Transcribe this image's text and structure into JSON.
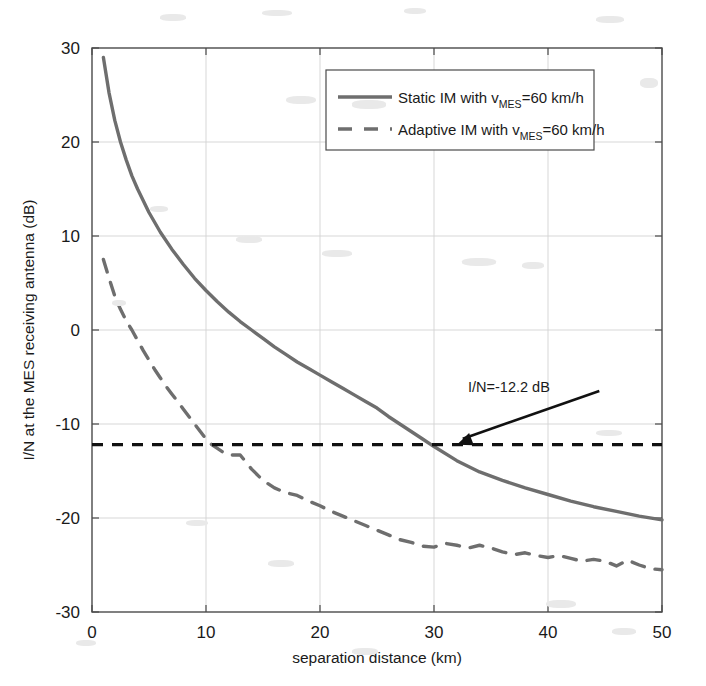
{
  "chart_data": {
    "type": "line",
    "title": "",
    "xlabel": "separation distance (km)",
    "ylabel": "I/N at the MES receiving antenna (dB)",
    "xlim": [
      0,
      50
    ],
    "ylim": [
      -30,
      30
    ],
    "xticks": [
      "0",
      "10",
      "20",
      "30",
      "40",
      "50"
    ],
    "xtick_values": [
      0,
      10,
      20,
      30,
      40,
      50
    ],
    "yticks": [
      "30",
      "20",
      "10",
      "0",
      "-10",
      "-20",
      "-30"
    ],
    "ytick_values": [
      30,
      20,
      10,
      0,
      -10,
      -20,
      -30
    ],
    "grid": true,
    "legend_position": "upper right",
    "series": [
      {
        "name": "Static IM with v_MES=60 km/h",
        "label_prefix": "Static IM with v",
        "label_sub": "MES",
        "label_suffix": "=60 km/h",
        "style": "solid",
        "color": "#6e6e6e",
        "x": [
          1,
          1.5,
          2,
          2.5,
          3,
          3.5,
          4,
          5,
          6,
          7,
          8,
          9,
          10,
          11,
          12,
          13,
          14,
          15,
          16,
          17,
          18,
          19,
          20,
          21,
          22,
          23,
          24,
          25,
          26,
          27,
          28,
          29,
          30,
          32,
          34,
          36,
          38,
          40,
          42,
          44,
          46,
          48,
          50
        ],
        "y": [
          29.0,
          25.2,
          22.3,
          20.0,
          18.1,
          16.4,
          15.0,
          12.5,
          10.4,
          8.6,
          7.0,
          5.5,
          4.2,
          3.0,
          1.9,
          0.9,
          0.0,
          -0.9,
          -1.8,
          -2.6,
          -3.4,
          -4.1,
          -4.8,
          -5.5,
          -6.2,
          -6.9,
          -7.6,
          -8.3,
          -9.2,
          -10.0,
          -10.8,
          -11.6,
          -12.4,
          -13.9,
          -15.1,
          -16.0,
          -16.8,
          -17.5,
          -18.2,
          -18.8,
          -19.3,
          -19.8,
          -20.2
        ]
      },
      {
        "name": "Adaptive IM with v_MES=60 km/h",
        "label_prefix": "Adaptive IM with v",
        "label_sub": "MES",
        "label_suffix": "=60 km/h",
        "style": "dashed",
        "color": "#6e6e6e",
        "x": [
          1,
          1.5,
          2,
          2.5,
          3,
          3.5,
          4,
          4.5,
          5,
          5.5,
          6,
          6.5,
          7,
          7.5,
          8,
          8.5,
          9,
          9.5,
          10,
          10.5,
          11,
          11.5,
          12,
          13,
          14,
          15,
          16,
          17,
          18,
          19,
          20,
          21,
          22,
          23,
          24,
          25,
          26,
          27,
          28,
          29,
          30,
          31,
          32,
          33,
          34,
          35,
          36,
          37,
          38,
          39,
          40,
          41,
          42,
          43,
          44,
          45,
          46,
          47,
          48,
          49,
          50
        ],
        "y": [
          7.5,
          5.5,
          3.6,
          2.2,
          1.0,
          0.0,
          -1.1,
          -2.2,
          -3.2,
          -4.2,
          -5.1,
          -6.0,
          -6.8,
          -7.6,
          -8.4,
          -9.2,
          -10.0,
          -10.8,
          -11.6,
          -12.2,
          -12.6,
          -13.0,
          -13.3,
          -13.3,
          -14.8,
          -16.0,
          -16.8,
          -17.3,
          -17.6,
          -18.2,
          -18.7,
          -19.3,
          -19.8,
          -20.3,
          -20.8,
          -21.3,
          -21.8,
          -22.3,
          -22.6,
          -23.0,
          -23.1,
          -22.7,
          -22.9,
          -23.2,
          -22.9,
          -23.2,
          -23.6,
          -23.9,
          -23.7,
          -24.0,
          -24.2,
          -24.0,
          -24.3,
          -24.6,
          -24.4,
          -24.6,
          -25.1,
          -24.5,
          -25.0,
          -25.4,
          -25.5
        ]
      }
    ],
    "threshold_line": {
      "label": "I/N=-12.2 dB",
      "value": -12.2,
      "style": "dashed",
      "color": "#111111"
    },
    "annotation": {
      "text": "I/N=-12.2 dB",
      "arrow_from_x": 44.5,
      "arrow_from_y": -6.5,
      "arrow_to_x": 32.0,
      "arrow_to_y": -12.2
    }
  },
  "axes": {
    "x_label": "separation distance (km)",
    "y_label": "I/N at the MES receiving antenna (dB)"
  }
}
